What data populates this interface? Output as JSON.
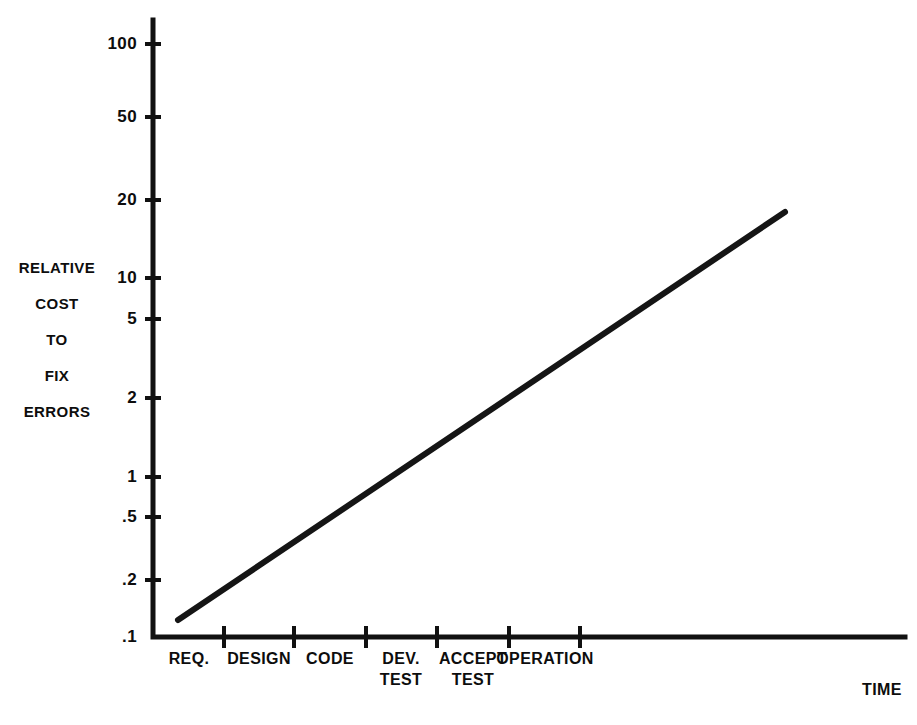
{
  "chart_data": {
    "type": "line",
    "title": "",
    "xlabel": "TIME",
    "ylabel": "RELATIVE COST TO FIX ERRORS",
    "yscale": "log",
    "ylim": [
      0.1,
      100
    ],
    "grid": false,
    "legend": null,
    "y_ticks": [
      {
        "label": "100",
        "value": 100,
        "y": 44
      },
      {
        "label": "50",
        "value": 50,
        "y": 117
      },
      {
        "label": "20",
        "value": 20,
        "y": 200
      },
      {
        "label": "10",
        "value": 10,
        "y": 278
      },
      {
        "label": "5",
        "value": 5,
        "y": 319
      },
      {
        "label": "2",
        "value": 2,
        "y": 398
      },
      {
        "label": "1",
        "value": 1,
        "y": 477
      },
      {
        "label": ".5",
        "value": 0.5,
        "y": 517
      },
      {
        "label": ".2",
        "value": 0.2,
        "y": 580
      },
      {
        "label": ".1",
        "value": 0.1,
        "y": 637
      }
    ],
    "categories": [
      "REQ.",
      "DESIGN",
      "CODE",
      "DEV. TEST",
      "ACCEPT TEST",
      "OPERATION"
    ],
    "x_category_labels": [
      {
        "lines": [
          "REQ."
        ],
        "center": 189
      },
      {
        "lines": [
          "DESIGN"
        ],
        "center": 259
      },
      {
        "lines": [
          "CODE"
        ],
        "center": 330
      },
      {
        "lines": [
          "DEV.",
          "TEST"
        ],
        "center": 401
      },
      {
        "lines": [
          "ACCEPT",
          "TEST"
        ],
        "center": 473
      },
      {
        "lines": [
          "OPERATION"
        ],
        "center": 545
      }
    ],
    "x_ticks": [
      224,
      294,
      366,
      437,
      509,
      580
    ],
    "series": [
      {
        "name": "relative cost to fix errors",
        "points": [
          {
            "phase": "REQ.",
            "value": 0.13
          },
          {
            "phase": "OPERATION",
            "value": 17
          }
        ],
        "pixel_start": {
          "x": 178,
          "y": 620
        },
        "pixel_end": {
          "x": 785,
          "y": 212
        },
        "color": "#151515"
      }
    ],
    "axis_geometry": {
      "x_origin": 153,
      "x_end": 905,
      "y_top": 20,
      "y_origin": 637
    }
  },
  "y_axis_title_lines": [
    "RELATIVE",
    "COST",
    "TO",
    "FIX",
    "ERRORS"
  ],
  "x_axis_title": "TIME",
  "colors": {
    "ink": "#111111",
    "line": "#151515",
    "background": "#ffffff"
  }
}
